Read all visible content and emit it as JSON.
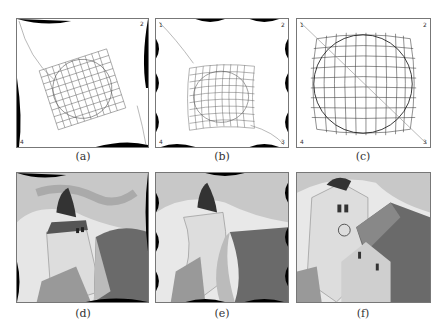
{
  "figure": {
    "top_row": [
      {
        "id": "a",
        "caption": "(a)",
        "description": "warped grid with circle, rotated, corners labeled 1-4",
        "corners": [
          "1",
          "2",
          "3",
          "4"
        ]
      },
      {
        "id": "b",
        "caption": "(b)",
        "description": "wavy distorted grid with circle, corners labeled 1-4",
        "corners": [
          "1",
          "2",
          "3",
          "4"
        ]
      },
      {
        "id": "c",
        "caption": "(c)",
        "description": "barrel-distorted grid with circle and diagonal line, corners labeled 1-4",
        "corners": [
          "1",
          "2",
          "3",
          "4"
        ]
      }
    ],
    "bottom_row": [
      {
        "id": "d",
        "caption": "(d)",
        "description": "warped church photo (rotational)"
      },
      {
        "id": "e",
        "caption": "(e)",
        "description": "warped church photo (wavy)"
      },
      {
        "id": "f",
        "caption": "(f)",
        "description": "church photo with barrel distortion"
      }
    ]
  }
}
